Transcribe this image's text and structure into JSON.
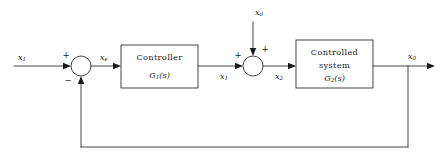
{
  "diagram": {
    "kind": "control-system-block-diagram",
    "width": 444,
    "height": 162,
    "background_color": "#ffffff",
    "line_color": "#1a1a1a",
    "text_color": "#1a1a1a"
  },
  "signals": {
    "input": {
      "base": "x",
      "sub": "1",
      "full": "x1"
    },
    "error": {
      "base": "x",
      "sub": "e",
      "full": "xe"
    },
    "controller_output": {
      "base": "x",
      "sub": "1",
      "full": "x1"
    },
    "disturbance": {
      "base": "x",
      "sub": "d",
      "full": "xd"
    },
    "plant_input": {
      "base": "x",
      "sub": "2",
      "full": "x2"
    },
    "output": {
      "base": "x",
      "sub": "0",
      "full": "x0"
    }
  },
  "blocks": [
    {
      "id": "controller",
      "title": "Controller",
      "transfer_base": "G",
      "transfer_sub": "1",
      "transfer_arg": "(s)",
      "transfer_full": "G1 (s)"
    },
    {
      "id": "controlled-system",
      "title_line1": "Controlled",
      "title_line2": "system",
      "transfer_base": "G",
      "transfer_sub": "2",
      "transfer_arg": "(s)",
      "transfer_full": "G2 (s)"
    }
  ],
  "summing_junctions": [
    {
      "id": "error-junction",
      "input_sign": "+",
      "feedback_sign": "−"
    },
    {
      "id": "disturbance-junction",
      "input_sign": "+",
      "disturbance_sign": "+"
    }
  ]
}
